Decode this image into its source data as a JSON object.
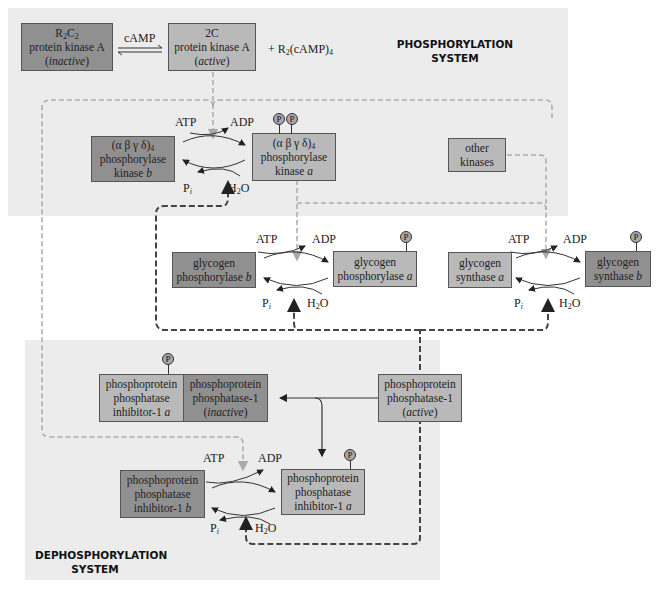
{
  "regions": {
    "phosphorylation_label_line1": "PHOSPHORYLATION",
    "phosphorylation_label_line2": "SYSTEM",
    "dephosphorylation_label_line1": "DEPHOSPHORYLATION",
    "dephosphorylation_label_line2": "SYSTEM"
  },
  "pka": {
    "inactive": {
      "line1": "R2C2",
      "line2": "protein kinase A",
      "line3": "inactive"
    },
    "active": {
      "line1": "2C",
      "line2": "protein kinase A",
      "line3": "active"
    },
    "effector": "cAMP",
    "byproduct": "+ R2(cAMP)4"
  },
  "phosphorylase_kinase": {
    "b": {
      "line1": "(α β γ δ)4",
      "line2": "phosphorylase",
      "line3": "kinase b"
    },
    "a": {
      "line1": "(α β γ δ)4",
      "line2": "phosphorylase",
      "line3": "kinase a"
    }
  },
  "other_kinases": {
    "line1": "other",
    "line2": "kinases"
  },
  "glycogen_phosphorylase": {
    "b": {
      "line1": "glycogen",
      "line2": "phosphorylase b"
    },
    "a": {
      "line1": "glycogen",
      "line2": "phosphorylase a"
    }
  },
  "glycogen_synthase": {
    "a": {
      "line1": "glycogen",
      "line2": "synthase a"
    },
    "b": {
      "line1": "glycogen",
      "line2": "synthase b"
    }
  },
  "inhibitor_complex": {
    "inhibitor": {
      "line1": "phosphoprotein",
      "line2": "phosphatase",
      "line3": "inhibitor-1 a"
    },
    "pp1_inactive": {
      "line1": "phosphoprotein",
      "line2": "phosphatase-1",
      "line3": "inactive"
    }
  },
  "pp1_active": {
    "line1": "phosphoprotein",
    "line2": "phosphatase-1",
    "line3": "active"
  },
  "inhibitor1": {
    "b": {
      "line1": "phosphoprotein",
      "line2": "phosphatase",
      "line3": "inhibitor-1 b"
    },
    "a": {
      "line1": "phosphoprotein",
      "line2": "phosphatase",
      "line3": "inhibitor-1 a"
    }
  },
  "cycle_labels": {
    "atp": "ATP",
    "adp": "ADP",
    "pi": "Pi",
    "h2o": "H2O"
  },
  "phospho_tag": "P",
  "colors": {
    "region_bg": "#ececec",
    "box_dark": "#909090",
    "box_light": "#b9b9b9",
    "dashed_light": "#aaaaaa",
    "dashed_dark": "#444444"
  }
}
